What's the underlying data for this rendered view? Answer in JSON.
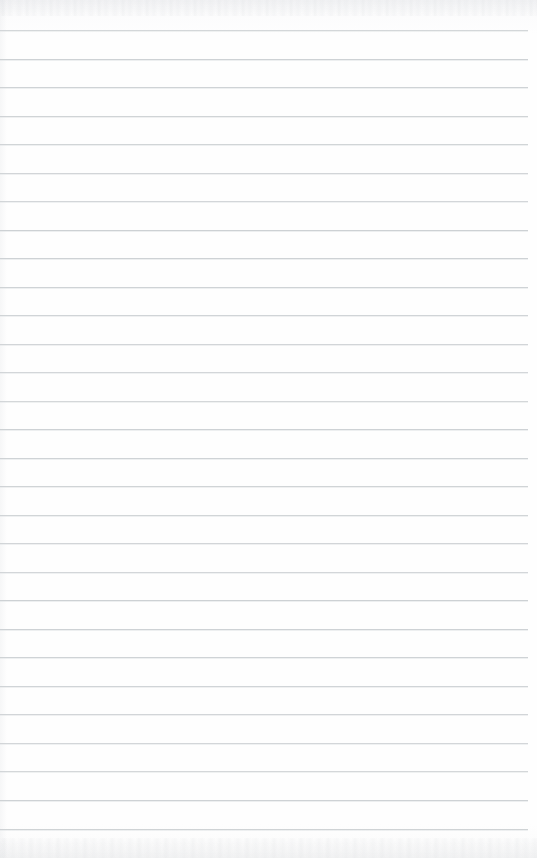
{
  "page": {
    "kind": "ruled-notebook-page",
    "width": 537,
    "height": 858,
    "background_color": "#fdfdfd",
    "content_text": "",
    "has_text": false,
    "has_margin_rule": false
  },
  "ruling": {
    "line_color": "#ccd0d3",
    "line_thickness_px": 1,
    "line_spacing_px": 28.5,
    "first_line_y": 30,
    "last_line_y": 829,
    "line_start_x": 0,
    "line_end_x": 528,
    "line_count": 29,
    "line_y_positions": [
      30,
      58.5,
      87,
      115.5,
      144,
      172.5,
      201,
      229.5,
      258,
      286.5,
      315,
      343.5,
      372,
      400.5,
      429,
      457.5,
      486,
      514.5,
      543,
      571.5,
      600,
      628.5,
      657,
      685.5,
      714,
      742.5,
      771,
      800,
      829
    ]
  },
  "texture": {
    "top_edge_noise": true,
    "bottom_edge_noise": true,
    "left_edge_artifact": true,
    "noise_color": "#cdd0d4"
  }
}
